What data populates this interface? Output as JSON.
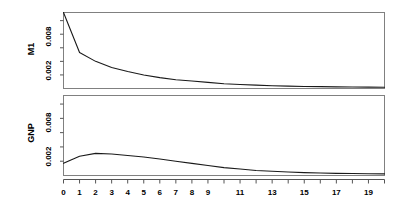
{
  "figure": {
    "background_color": "#ffffff",
    "line_color": "#1a1a1a",
    "frame_color": "#808080"
  },
  "panels": [
    {
      "name": "M1",
      "ylabel": "M1",
      "ytick_labels": [
        "0.002",
        "0.008"
      ]
    },
    {
      "name": "GNP",
      "ylabel": "GNP",
      "ytick_labels": [
        "0.002",
        "0.008"
      ]
    }
  ],
  "xaxis": {
    "tick_labels": [
      "0",
      "1",
      "2",
      "3",
      "4",
      "5",
      "6",
      "7",
      "8",
      "9",
      "11",
      "13",
      "15",
      "17",
      "19"
    ]
  },
  "chart_data": {
    "type": "line",
    "title": "",
    "xlabel": "",
    "ylabel": "",
    "layout": "two stacked panels sharing one x-axis",
    "grid": false,
    "legend": "none",
    "xlim": [
      0,
      20
    ],
    "ylim": [
      0,
      0.0112
    ],
    "x": [
      0,
      1,
      2,
      3,
      4,
      5,
      6,
      7,
      8,
      9,
      10,
      11,
      12,
      13,
      14,
      15,
      16,
      17,
      18,
      19,
      20
    ],
    "yticks": [
      0.002,
      0.008
    ],
    "xticks": [
      0,
      1,
      2,
      3,
      4,
      5,
      6,
      7,
      8,
      9,
      10,
      11,
      12,
      13,
      14,
      15,
      16,
      17,
      18,
      19,
      20
    ],
    "series": [
      {
        "name": "M1",
        "panel": "M1",
        "values": [
          0.0112,
          0.0053,
          0.004,
          0.0031,
          0.0025,
          0.002,
          0.0016,
          0.0013,
          0.0011,
          0.0009,
          0.0007,
          0.0006,
          0.0005,
          0.0004,
          0.00035,
          0.0003,
          0.00027,
          0.00024,
          0.00022,
          0.0002,
          0.00019
        ]
      },
      {
        "name": "GNP",
        "panel": "GNP",
        "values": [
          0.0017,
          0.0027,
          0.0031,
          0.003,
          0.0028,
          0.0026,
          0.0023,
          0.002,
          0.0017,
          0.0014,
          0.0011,
          0.0009,
          0.0007,
          0.0006,
          0.0005,
          0.0004,
          0.00035,
          0.0003,
          0.00027,
          0.00025,
          0.00023
        ]
      }
    ]
  }
}
